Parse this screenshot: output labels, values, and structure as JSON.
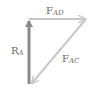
{
  "diagram": {
    "type": "force-triangle",
    "colors": {
      "light_arrow": "#c8c8c8",
      "dark_arrow": "#8a8a8a",
      "label": "#666666"
    },
    "vectors": [
      {
        "id": "F_AD",
        "label_main": "F",
        "label_sub": "AD",
        "from": [
          29,
          19
        ],
        "to": [
          86,
          19
        ],
        "direction": "right"
      },
      {
        "id": "F_AC",
        "label_main": "F",
        "label_sub": "AC",
        "from": [
          86,
          19
        ],
        "to": [
          31,
          84
        ],
        "direction": "down-left"
      },
      {
        "id": "R_A",
        "label_main": "R",
        "label_sub": "A",
        "from": [
          29,
          84
        ],
        "to": [
          29,
          19
        ],
        "direction": "up"
      }
    ]
  }
}
